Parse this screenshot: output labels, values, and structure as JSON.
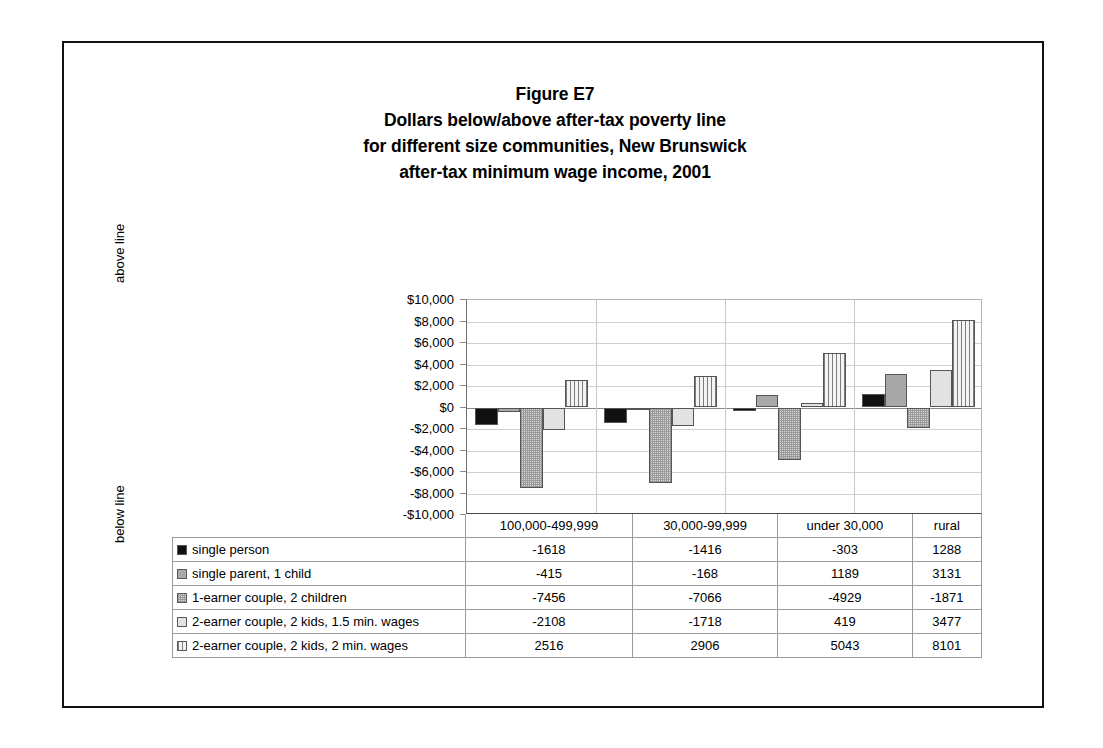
{
  "figure": {
    "title_lines": [
      "Figure E7",
      "Dollars below/above after-tax poverty line",
      "for different size communities, New Brunswick",
      "after-tax minimum wage income, 2001"
    ],
    "caption_above": "above line",
    "caption_below": "below line"
  },
  "chart_data": {
    "type": "bar",
    "xlabel": "",
    "ylabel": "",
    "ylim": [
      -10000,
      10000
    ],
    "grid": true,
    "legend_position": "table-below",
    "categories": [
      "100,000-499,999",
      "30,000-99,999",
      "under 30,000",
      "rural"
    ],
    "ytick_labels": [
      "$10,000",
      "$8,000",
      "$6,000",
      "$4,000",
      "$2,000",
      "$0",
      "-$2,000",
      "-$4,000",
      "-$6,000",
      "-$8,000",
      "-$10,000"
    ],
    "ytick_values": [
      10000,
      8000,
      6000,
      4000,
      2000,
      0,
      -2000,
      -4000,
      -6000,
      -8000,
      -10000
    ],
    "series": [
      {
        "name": "single person",
        "fill": "solid-black",
        "values": [
          -1618,
          -1416,
          -303,
          1288
        ]
      },
      {
        "name": "single parent, 1 child",
        "fill": "solid-gray",
        "values": [
          -415,
          -168,
          1189,
          3131
        ]
      },
      {
        "name": "1-earner couple, 2 children",
        "fill": "speckle",
        "values": [
          -7456,
          -7066,
          -4929,
          -1871
        ]
      },
      {
        "name": "2-earner couple, 2 kids, 1.5 min. wages",
        "fill": "light",
        "values": [
          -2108,
          -1718,
          419,
          3477
        ]
      },
      {
        "name": "2-earner couple, 2 kids, 2 min. wages",
        "fill": "vstripe",
        "values": [
          2516,
          2906,
          5043,
          8101
        ]
      }
    ]
  },
  "colors": {
    "series_black": "#111111",
    "series_gray": "#a8a8a8",
    "series_speckle": "#d9d9d9",
    "series_light": "#e2e2e2",
    "series_stripe": "#f2f2f2",
    "gridline": "#cfcfcf",
    "frame": "#111111"
  }
}
